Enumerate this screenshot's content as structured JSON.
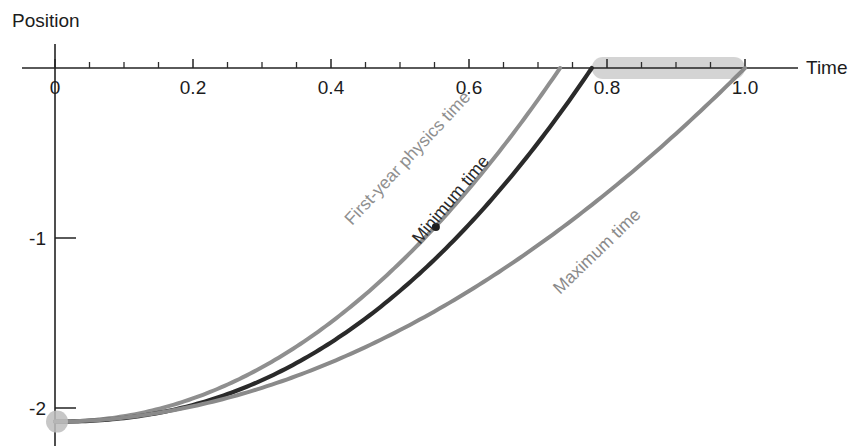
{
  "chart_data": {
    "type": "line",
    "title": "",
    "xlabel": "Time",
    "ylabel": "Position",
    "xlim": [
      -0.02,
      1.06
    ],
    "ylim": [
      -2.35,
      0.08
    ],
    "grid": false,
    "legend_position": "inline-curve-labels",
    "x_ticks_major": [
      "0",
      "0.2",
      "0.4",
      "0.6",
      "0.8",
      "1.0"
    ],
    "x_tick_values_major": [
      0,
      0.2,
      0.4,
      0.6,
      0.8,
      1.0
    ],
    "x_tick_minor_step": 0.05,
    "y_ticks_major": [
      "-1",
      "-2"
    ],
    "y_tick_values_major": [
      -1,
      -2
    ],
    "start_point": {
      "x": 0,
      "y": -2.08,
      "marker": "gray-disc"
    },
    "annotation_marker": {
      "x": 0.552,
      "y": -0.935,
      "marker": "small-dark-dot"
    },
    "highlight_bar": {
      "x_start": 0.778,
      "x_end": 1.0,
      "y": 0.0,
      "color": "#cccccc"
    },
    "series": [
      {
        "name": "First-year physics time",
        "label": "First-year physics time",
        "color": "#8f8f8f",
        "width": 4.0,
        "x_end": 0.732,
        "points": [
          [
            0.0,
            -2.08
          ],
          [
            0.05,
            -2.075
          ],
          [
            0.1,
            -2.058
          ],
          [
            0.15,
            -2.028
          ],
          [
            0.2,
            -1.986
          ],
          [
            0.25,
            -1.931
          ],
          [
            0.3,
            -1.861
          ],
          [
            0.35,
            -1.775
          ],
          [
            0.4,
            -1.673
          ],
          [
            0.45,
            -1.553
          ],
          [
            0.5,
            -1.414
          ],
          [
            0.55,
            -1.256
          ],
          [
            0.6,
            -1.078
          ],
          [
            0.65,
            -0.876
          ],
          [
            0.7,
            -0.648
          ],
          [
            0.732,
            -0.481
          ],
          [
            0.76,
            -0.32
          ],
          [
            0.778,
            -0.15
          ],
          [
            0.79,
            0.0
          ]
        ]
      },
      {
        "name": "Minimum time",
        "label": "Minimum time",
        "color": "#2a2a2a",
        "width": 4.2,
        "x_end": 0.778,
        "points": [
          [
            0.0,
            -2.08
          ],
          [
            0.05,
            -2.078
          ],
          [
            0.1,
            -2.068
          ],
          [
            0.15,
            -2.048
          ],
          [
            0.2,
            -2.018
          ],
          [
            0.25,
            -1.975
          ],
          [
            0.3,
            -1.918
          ],
          [
            0.35,
            -1.846
          ],
          [
            0.4,
            -1.758
          ],
          [
            0.45,
            -1.653
          ],
          [
            0.5,
            -1.53
          ],
          [
            0.552,
            -0.935
          ],
          [
            0.6,
            -1.23
          ],
          [
            0.65,
            -1.05
          ],
          [
            0.7,
            -0.845
          ],
          [
            0.75,
            -0.61
          ],
          [
            0.778,
            -0.45
          ],
          [
            0.8,
            -0.22
          ],
          [
            0.815,
            0.0
          ]
        ]
      },
      {
        "name": "Maximum time",
        "label": "Maximum time",
        "color": "#8a8a8a",
        "width": 4.0,
        "x_end": 1.0,
        "points": [
          [
            0.0,
            -2.08
          ],
          [
            0.05,
            -2.079
          ],
          [
            0.1,
            -2.073
          ],
          [
            0.15,
            -2.062
          ],
          [
            0.2,
            -2.044
          ],
          [
            0.25,
            -2.019
          ],
          [
            0.3,
            -1.986
          ],
          [
            0.35,
            -1.944
          ],
          [
            0.4,
            -1.892
          ],
          [
            0.45,
            -1.83
          ],
          [
            0.5,
            -1.757
          ],
          [
            0.55,
            -1.672
          ],
          [
            0.6,
            -1.574
          ],
          [
            0.65,
            -1.463
          ],
          [
            0.7,
            -1.338
          ],
          [
            0.75,
            -1.197
          ],
          [
            0.8,
            -1.04
          ],
          [
            0.85,
            -0.866
          ],
          [
            0.9,
            -0.672
          ],
          [
            0.95,
            -0.455
          ],
          [
            1.0,
            -0.21
          ]
        ]
      }
    ]
  },
  "axis": {
    "x_label": "Time",
    "y_label": "Position"
  },
  "colors": {
    "axis": "#232323",
    "dark_curve": "#2a2a2a",
    "gray_curve": "#8a8a8a",
    "light_gray_curve": "#8f8f8f",
    "highlight": "#cccccc",
    "start_dot": "#bdbdbd",
    "text": "#1c1c1c"
  }
}
